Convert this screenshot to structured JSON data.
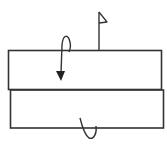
{
  "diagram": {
    "stroke_color": "#333333",
    "background": "#ffffff",
    "elements": {
      "top_panel": {
        "x": 8,
        "y": 50,
        "width": 154,
        "height": 40
      },
      "bottom_panel": {
        "x": 10,
        "y": 90,
        "width": 154,
        "height": 38
      },
      "flag_marker": {
        "pole_x": 99,
        "top_y": 12,
        "base_y": 50
      },
      "fold_arrow": {
        "type": "valley-fold-over",
        "x": 60
      },
      "turn_over_arrow": {
        "type": "turn-over",
        "x": 88
      }
    }
  }
}
